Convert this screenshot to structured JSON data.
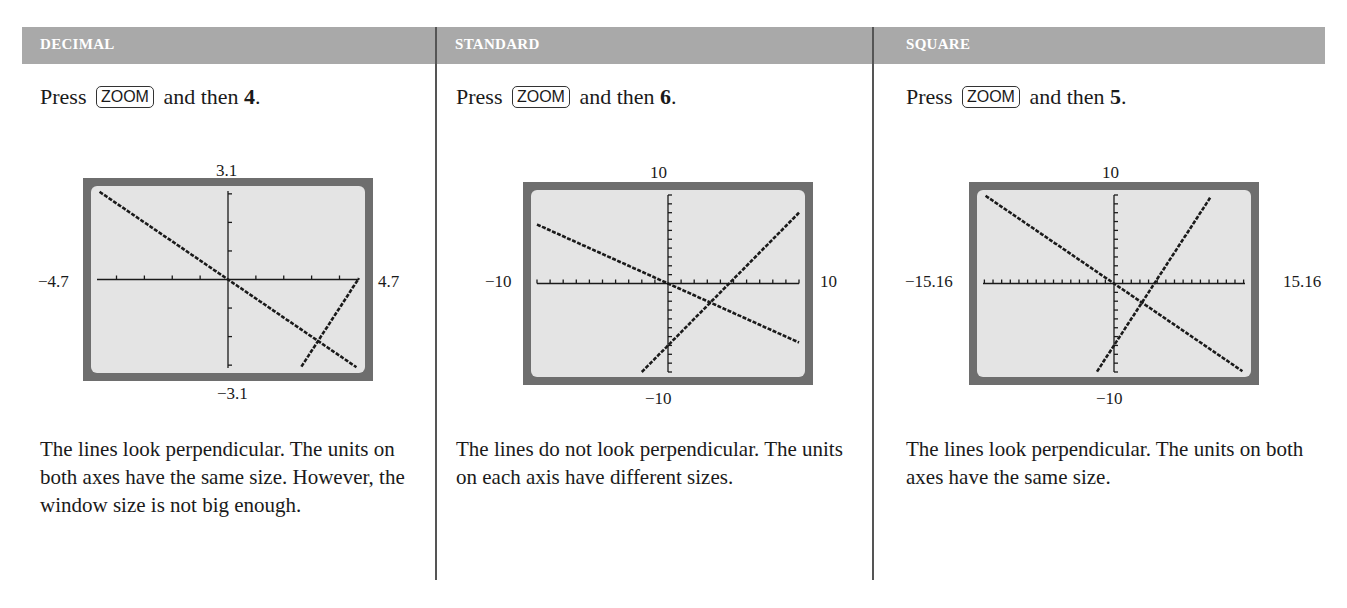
{
  "columns": [
    {
      "title": "DECIMAL",
      "instruction": {
        "prefix": "Press",
        "key": "ZOOM",
        "suffix": "and then",
        "number": "4",
        "end": "."
      },
      "window": {
        "xmin": "−4.7",
        "xmax": "4.7",
        "ymin": "−3.1",
        "ymax": "3.1"
      },
      "caption": "The lines look perpendicular. The units on both axes have the same size. However, the window size is not big enough."
    },
    {
      "title": "STANDARD",
      "instruction": {
        "prefix": "Press",
        "key": "ZOOM",
        "suffix": "and then",
        "number": "6",
        "end": "."
      },
      "window": {
        "xmin": "−10",
        "xmax": "10",
        "ymin": "−10",
        "ymax": "10"
      },
      "caption": "The lines do not look perpendicular. The units on each axis have different sizes."
    },
    {
      "title": "SQUARE",
      "instruction": {
        "prefix": "Press",
        "key": "ZOOM",
        "suffix": "and then",
        "number": "5",
        "end": "."
      },
      "window": {
        "xmin": "−15.16",
        "xmax": "15.16",
        "ymin": "−10",
        "ymax": "10"
      },
      "caption": "The lines look perpendicular. The units on both axes have the same size."
    }
  ],
  "chart_data": [
    {
      "type": "line",
      "title": "DECIMAL",
      "xlim": [
        -4.7,
        4.7
      ],
      "ylim": [
        -3.1,
        3.1
      ],
      "xtick_step": 1,
      "ytick_step": 1,
      "series": [
        {
          "name": "line 1",
          "equation": "y = -2/3 x"
        },
        {
          "name": "line 2",
          "equation": "y = 3/2 x - 7"
        }
      ]
    },
    {
      "type": "line",
      "title": "STANDARD",
      "xlim": [
        -10,
        10
      ],
      "ylim": [
        -10,
        10
      ],
      "xtick_step": 1,
      "ytick_step": 1,
      "series": [
        {
          "name": "line 1",
          "equation": "y = -2/3 x"
        },
        {
          "name": "line 2",
          "equation": "y = 3/2 x - 7"
        }
      ]
    },
    {
      "type": "line",
      "title": "SQUARE",
      "xlim": [
        -15.16,
        15.16
      ],
      "ylim": [
        -10,
        10
      ],
      "xtick_step": 1,
      "ytick_step": 1,
      "series": [
        {
          "name": "line 1",
          "equation": "y = -2/3 x"
        },
        {
          "name": "line 2",
          "equation": "y = 3/2 x - 7"
        }
      ]
    }
  ],
  "colors": {
    "header": "#a9a9a9",
    "screen": "#e4e4e4",
    "frame": "#6e6e6e",
    "plot": "#1a1a1a"
  }
}
